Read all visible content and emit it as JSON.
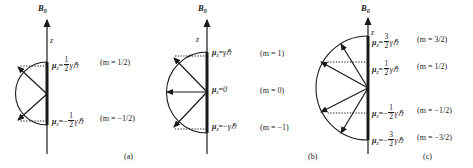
{
  "figure": {
    "title_text": "Space quantization of magnetic moment vectors in a magnetic field",
    "background_color": "#ffffff",
    "ink_color": "#1a1a1a"
  },
  "panels": [
    {
      "id": "a",
      "caption": "(a)",
      "field_symbol": "B",
      "field_subscript": "0",
      "axis_label": "z",
      "levels": [
        {
          "mu_symbol": "μ",
          "mu_subscript": "z",
          "equals": "=",
          "sign": "",
          "numerator": "1",
          "denominator": "2",
          "unit": "γℏ",
          "m_label": "(m = 1/2)"
        },
        {
          "mu_symbol": "μ",
          "mu_subscript": "z",
          "equals": "=",
          "sign": "−",
          "numerator": "1",
          "denominator": "2",
          "unit": "γℏ",
          "m_label": "(m = −1/2)"
        }
      ]
    },
    {
      "id": "b",
      "caption": "(b)",
      "field_symbol": "B",
      "field_subscript": "0",
      "axis_label": "z",
      "levels": [
        {
          "mu_symbol": "μ",
          "mu_subscript": "z",
          "equals": "=",
          "sign": "",
          "numerator": "",
          "denominator": "",
          "unit": "γℏ",
          "m_label": "(m = 1)"
        },
        {
          "mu_symbol": "μ",
          "mu_subscript": "z",
          "equals": "=",
          "sign": "",
          "numerator": "",
          "denominator": "",
          "unit": "0",
          "m_label": "(m = 0)"
        },
        {
          "mu_symbol": "μ",
          "mu_subscript": "z",
          "equals": "=",
          "sign": "−",
          "numerator": "",
          "denominator": "",
          "unit": "γℏ",
          "m_label": "(m = −1)"
        }
      ]
    },
    {
      "id": "c",
      "caption": "(c)",
      "field_symbol": "B",
      "field_subscript": "0",
      "axis_label": "z",
      "levels": [
        {
          "mu_symbol": "μ",
          "mu_subscript": "z",
          "equals": "=",
          "sign": "",
          "numerator": "3",
          "denominator": "2",
          "unit": "γℏ",
          "m_label": "(m = 3/2)"
        },
        {
          "mu_symbol": "μ",
          "mu_subscript": "z",
          "equals": "=",
          "sign": "",
          "numerator": "1",
          "denominator": "2",
          "unit": "γℏ",
          "m_label": "(m = 1/2)"
        },
        {
          "mu_symbol": "μ",
          "mu_subscript": "z",
          "equals": "=",
          "sign": "−",
          "numerator": "1",
          "denominator": "2",
          "unit": "γℏ",
          "m_label": "(m = −1/2)"
        },
        {
          "mu_symbol": "μ",
          "mu_subscript": "z",
          "equals": "=",
          "sign": "−",
          "numerator": "3",
          "denominator": "2",
          "unit": "γℏ",
          "m_label": "(m = −3/2)"
        }
      ]
    }
  ]
}
